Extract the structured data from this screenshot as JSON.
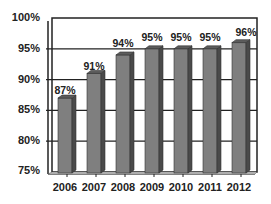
{
  "chart_data": {
    "type": "bar",
    "title": "",
    "xlabel": "",
    "ylabel": "",
    "categories": [
      "2006",
      "2007",
      "2008",
      "2009",
      "2010",
      "2011",
      "2012"
    ],
    "values": [
      87,
      91,
      94,
      95,
      95,
      95,
      96
    ],
    "data_labels": [
      "87%",
      "91%",
      "94%",
      "95%",
      "95%",
      "95%",
      "96%"
    ],
    "ylim": [
      75,
      100
    ],
    "y_ticks": [
      "100%",
      "95%",
      "90%",
      "85%",
      "80%",
      "75%"
    ],
    "grid": true,
    "legend": "none",
    "style": "3d-column",
    "bar_color": "#7f7f7f"
  }
}
